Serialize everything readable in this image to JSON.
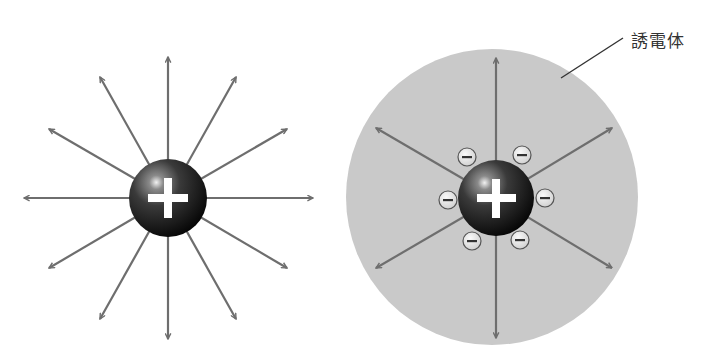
{
  "figure": {
    "left_panel": {
      "description": "Electric field lines of a positive point charge in vacuum",
      "charge_symbol": "+",
      "field_line_count": 12
    },
    "right_panel": {
      "description": "Positive charge inside a dielectric, surrounded by induced negative charges; fewer field lines",
      "charge_symbol": "+",
      "induced_charge_symbol": "−",
      "induced_charge_count": 6,
      "field_line_count": 6,
      "dielectric_label": "誘電体"
    },
    "colors": {
      "background": "#ffffff",
      "arrow": "#6e6e6e",
      "dielectric_fill": "#c9c9c9",
      "sphere_dark": "#111111",
      "sphere_highlight": "#f2f2f2",
      "ion_fill": "#e6e6e6",
      "ion_stroke": "#555555",
      "leader_line": "#333333"
    }
  }
}
